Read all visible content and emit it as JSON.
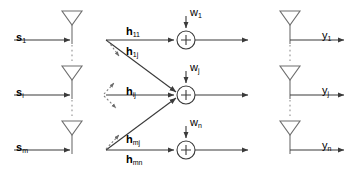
{
  "diagram": {
    "colors": {
      "stroke": "#3a3a3a",
      "dashed": "#8a8a8a",
      "text": "#000000",
      "background": "#ffffff"
    },
    "inputs": [
      {
        "id": "s1",
        "base": "s",
        "sub": "1",
        "x": 16,
        "y": 28,
        "arrow_y": 40
      },
      {
        "id": "si",
        "base": "s",
        "sub": "i",
        "x": 16,
        "y": 83,
        "arrow_y": 95
      },
      {
        "id": "sm",
        "base": "s",
        "sub": "m",
        "x": 16,
        "y": 138,
        "arrow_y": 150
      }
    ],
    "tx_antennas": [
      {
        "id": "tx-1",
        "cx": 72,
        "top": 10
      },
      {
        "id": "tx-2",
        "cx": 72,
        "top": 65
      },
      {
        "id": "tx-3",
        "cx": 72,
        "top": 120
      }
    ],
    "tx_dotted_gaps": [
      {
        "x": 72,
        "y1": 44,
        "y2": 64
      },
      {
        "x": 72,
        "y1": 99,
        "y2": 119
      }
    ],
    "channel_labels": [
      {
        "id": "h11",
        "base": "h",
        "sub": "11",
        "x": 126,
        "y": 22
      },
      {
        "id": "h1j",
        "base": "h",
        "sub": "1j",
        "x": 126,
        "y": 42
      },
      {
        "id": "hij",
        "base": "h",
        "sub": "ij",
        "x": 126,
        "y": 82
      },
      {
        "id": "hmj",
        "base": "h",
        "sub": "mj",
        "x": 126,
        "y": 130
      },
      {
        "id": "hmn",
        "base": "h",
        "sub": "mn",
        "x": 126,
        "y": 150
      }
    ],
    "noise_labels": [
      {
        "id": "w1",
        "base": "w",
        "sub": "1",
        "x": 180,
        "y": 8
      },
      {
        "id": "wj",
        "base": "w",
        "sub": "j",
        "x": 180,
        "y": 63
      },
      {
        "id": "wn",
        "base": "w",
        "sub": "n",
        "x": 180,
        "y": 118
      }
    ],
    "adders": [
      {
        "id": "adder-1",
        "cx": 186,
        "cy": 40,
        "r": 9,
        "symbol": "+"
      },
      {
        "id": "adder-2",
        "cx": 186,
        "cy": 95,
        "r": 9,
        "symbol": "+"
      },
      {
        "id": "adder-3",
        "cx": 186,
        "cy": 150,
        "r": 9,
        "symbol": "+"
      }
    ],
    "rx_antennas": [
      {
        "id": "rx-1",
        "cx": 290,
        "top": 10
      },
      {
        "id": "rx-2",
        "cx": 290,
        "top": 65
      },
      {
        "id": "rx-3",
        "cx": 290,
        "top": 120
      }
    ],
    "rx_dotted_gaps": [
      {
        "x": 290,
        "y1": 44,
        "y2": 64
      },
      {
        "x": 290,
        "y1": 99,
        "y2": 119
      }
    ],
    "outputs": [
      {
        "id": "y1",
        "base": "y",
        "sub": "1",
        "x": 322,
        "y": 28,
        "arrow_y": 40
      },
      {
        "id": "yj",
        "base": "y",
        "sub": "j",
        "x": 322,
        "y": 83,
        "arrow_y": 95
      },
      {
        "id": "yn",
        "base": "y",
        "sub": "n",
        "x": 322,
        "y": 138,
        "arrow_y": 150
      }
    ]
  }
}
